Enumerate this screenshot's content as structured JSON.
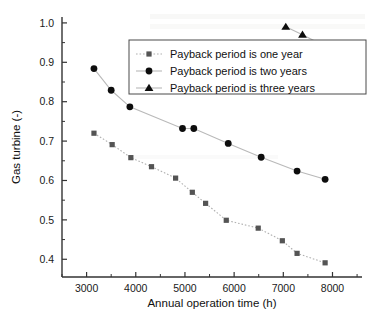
{
  "chart_data": {
    "type": "scatter",
    "title": "",
    "xlabel": "Annual operation time (h)",
    "ylabel": "Gas turbine (-)",
    "xlim": [
      2500,
      8600
    ],
    "ylim": [
      0.355,
      1.015
    ],
    "xticks": [
      3000,
      4000,
      5000,
      6000,
      7000,
      8000
    ],
    "xtick_labels": [
      "3000",
      "4000",
      "5000",
      "6000",
      "7000",
      "8000"
    ],
    "yticks": [
      0.4,
      0.5,
      0.6,
      0.7,
      0.8,
      0.9,
      1.0
    ],
    "ytick_labels": [
      "0.4",
      "0.5",
      "0.6",
      "0.7",
      "0.8",
      "0.9",
      "1.0"
    ],
    "grid": false,
    "legend_position": "upper-center",
    "series": [
      {
        "name": "Payback period is one year",
        "marker": "square",
        "color": "#545454",
        "line_style": "dotted",
        "x": [
          3150,
          3520,
          3900,
          4320,
          4810,
          5150,
          5420,
          5840,
          6490,
          6980,
          7280,
          7850
        ],
        "y": [
          0.72,
          0.691,
          0.658,
          0.635,
          0.606,
          0.57,
          0.542,
          0.499,
          0.479,
          0.447,
          0.415,
          0.391
        ]
      },
      {
        "name": "Payback period is two years",
        "marker": "circle",
        "color": "#0d0d0d",
        "line_style": "solid",
        "x": [
          3150,
          3500,
          3880,
          4950,
          5180,
          5880,
          6550,
          7280,
          7850
        ],
        "y": [
          0.884,
          0.829,
          0.787,
          0.732,
          0.732,
          0.694,
          0.659,
          0.624,
          0.603
        ]
      },
      {
        "name": "Payback period is three years",
        "marker": "triangle",
        "color": "#0d0d0d",
        "line_style": "solid",
        "x": [
          7050,
          7390,
          7880
        ],
        "y": [
          0.99,
          0.97,
          0.939
        ]
      }
    ]
  },
  "legend": {
    "entries": [
      {
        "label": "Payback period is one year"
      },
      {
        "label": "Payback period is two years"
      },
      {
        "label": "Payback period is three years"
      }
    ]
  }
}
